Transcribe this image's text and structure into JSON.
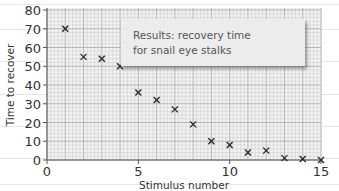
{
  "chart_data": {
    "type": "scatter",
    "title": "",
    "annotation": [
      "Results: recovery time",
      "for snail eye stalks"
    ],
    "xlabel": "Stimulus number",
    "ylabel": "Time to recover",
    "xlim": [
      0,
      15
    ],
    "ylim": [
      0,
      80
    ],
    "xticks": [
      0,
      5,
      10,
      15
    ],
    "yticks": [
      0,
      10,
      20,
      30,
      40,
      50,
      60,
      70,
      80
    ],
    "grid": true,
    "marker": "x",
    "series": [
      {
        "name": "recovery time",
        "x": [
          1,
          2,
          3,
          4,
          5,
          6,
          7,
          8,
          9,
          10,
          11,
          12,
          13,
          14,
          15
        ],
        "y": [
          70,
          55,
          54,
          50,
          36,
          32,
          27,
          19,
          10,
          8,
          4,
          5,
          1,
          0.5,
          0
        ]
      }
    ],
    "colors": {
      "marker": "#2b2b2b",
      "grid_minor": "#c8c8c8",
      "grid_major": "#a8a8a8",
      "plot_bg": "#f2f2f2",
      "axis": "#555555"
    }
  }
}
